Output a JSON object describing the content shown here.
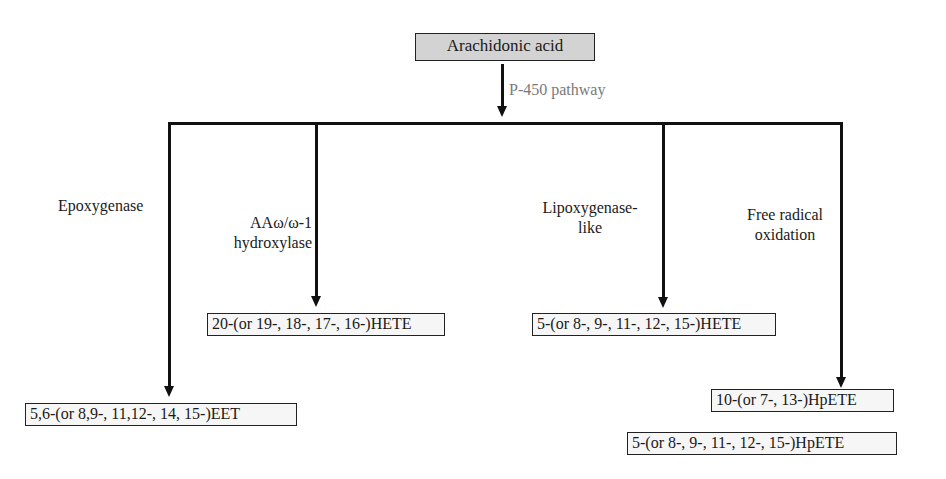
{
  "diagram": {
    "root": {
      "label": "Arachidonic acid"
    },
    "pathway_label": "P-450 pathway",
    "branches": [
      {
        "enzyme": "Epoxygenase",
        "enzyme_lines": [
          "Epoxygenase"
        ],
        "products": [
          "5,6-(or 8,9-, 11,12-, 14, 15-)EET"
        ]
      },
      {
        "enzyme": "AAω/ω-1 hydroxylase",
        "enzyme_lines": [
          "AAω/ω-1",
          "hydroxylase"
        ],
        "products": [
          "20-(or 19-, 18-, 17-, 16-)HETE"
        ]
      },
      {
        "enzyme": "Lipoxygenase-like",
        "enzyme_lines": [
          "Lipoxygenase-",
          "like"
        ],
        "products": [
          "5-(or 8-, 9-, 11-, 12-, 15-)HETE"
        ]
      },
      {
        "enzyme": "Free radical oxidation",
        "enzyme_lines": [
          "Free radical",
          "oxidation"
        ],
        "products": [
          "10-(or 7-, 13-)HpETE",
          "5-(or 8-, 9-, 11-, 12-, 15-)HpETE"
        ]
      }
    ]
  }
}
